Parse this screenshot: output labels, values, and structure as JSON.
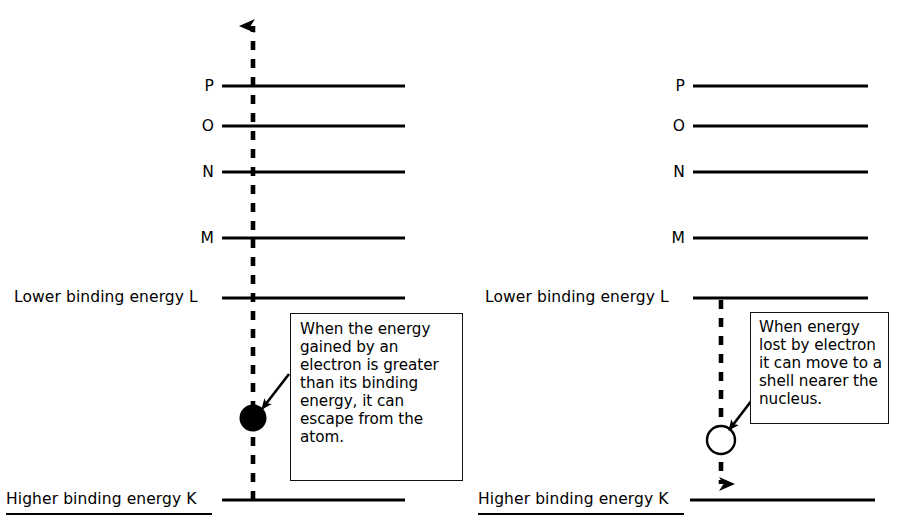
{
  "diagram": {
    "background_color": "#ffffff",
    "line_color": "#000000",
    "panels": [
      {
        "id": "left",
        "name": "electron-escape-panel",
        "shells": [
          {
            "id": "P",
            "label": "P",
            "label_type": "single",
            "y": 86
          },
          {
            "id": "O",
            "label": "O",
            "label_type": "single",
            "y": 126
          },
          {
            "id": "N",
            "label": "N",
            "label_type": "single",
            "y": 172
          },
          {
            "id": "M",
            "label": "M",
            "label_type": "single",
            "y": 238
          },
          {
            "id": "L",
            "label": "Lower binding energy L",
            "label_type": "full",
            "y": 298
          },
          {
            "id": "K",
            "label": "Higher binding energy K",
            "label_type": "full",
            "y": 500
          }
        ],
        "electron": {
          "style": "filled",
          "label": "electron",
          "cx": 253,
          "cy": 418,
          "r": 13
        },
        "arrow": {
          "direction": "up",
          "from_y": 500,
          "to_y": 10,
          "x": 253,
          "style": "dashed"
        },
        "callout": {
          "text": "When the energy gained by an electron is greater than its binding energy, it can escape from the atom."
        }
      },
      {
        "id": "right",
        "name": "electron-transition-panel",
        "shells": [
          {
            "id": "P",
            "label": "P",
            "label_type": "single",
            "y": 86
          },
          {
            "id": "O",
            "label": "O",
            "label_type": "single",
            "y": 126
          },
          {
            "id": "N",
            "label": "N",
            "label_type": "single",
            "y": 172
          },
          {
            "id": "M",
            "label": "M",
            "label_type": "single",
            "y": 238
          },
          {
            "id": "L",
            "label": "Lower binding energy L",
            "label_type": "full",
            "y": 298
          },
          {
            "id": "K",
            "label": "Higher binding energy K",
            "label_type": "full",
            "y": 500
          }
        ],
        "electron": {
          "style": "hollow",
          "label": "electron",
          "cx": 721,
          "cy": 440,
          "r": 13
        },
        "arrow": {
          "direction": "down",
          "from_y": 300,
          "to_y": 497,
          "x": 721,
          "style": "dashed"
        },
        "callout": {
          "text": "When energy lost by electron it can move to a shell nearer the nucleus."
        }
      }
    ]
  }
}
